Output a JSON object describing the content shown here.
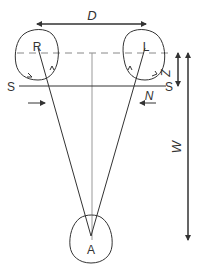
{
  "diagram": {
    "labels": {
      "distance": "D",
      "right_eye": "R",
      "left_eye": "L",
      "screen_left": "S",
      "screen_right": "S",
      "offset": "Z",
      "near_marker": "N",
      "viewing_distance": "W",
      "apex": "A"
    },
    "colors": {
      "stroke": "#333333",
      "dashed": "#888888",
      "background": "#ffffff"
    }
  }
}
